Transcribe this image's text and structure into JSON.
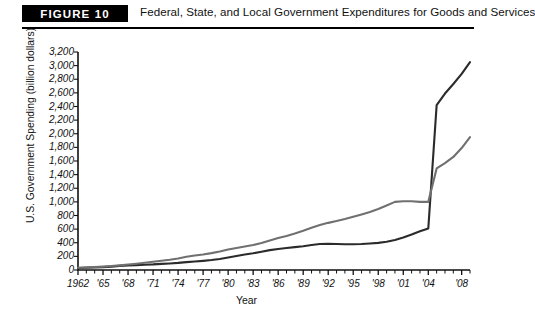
{
  "header": {
    "badge": "FIGURE 10",
    "caption": "Federal, State, and Local Government Expenditures for Goods and Services"
  },
  "axes": {
    "ylabel": "U.S. Government Spending (billion dollars)",
    "xlabel": "Year"
  },
  "chart_data": {
    "type": "line",
    "title": "Federal, State, and Local Government Expenditures for Goods and Services",
    "xlabel": "Year",
    "ylabel": "U.S. Government Spending (billion dollars)",
    "xlim": [
      1962,
      2009
    ],
    "ylim": [
      0,
      3200
    ],
    "grid": false,
    "legend": "none",
    "ytick_labels": [
      "3,200",
      "3,000",
      "2,800",
      "2,600",
      "2,400",
      "2,200",
      "2,000",
      "1,800",
      "1,600",
      "1,400",
      "1,200",
      "1,000",
      "800",
      "600",
      "400",
      "200",
      "0"
    ],
    "ytick_values": [
      3200,
      3000,
      2800,
      2600,
      2400,
      2200,
      2000,
      1800,
      1600,
      1400,
      1200,
      1000,
      800,
      600,
      400,
      200,
      0
    ],
    "xtick_labels": [
      "1962",
      "'65",
      "'68",
      "'71",
      "'74",
      "'77",
      "'80",
      "'83",
      "'86",
      "'89",
      "'92",
      "'95",
      "'98",
      "'01",
      "'04",
      "'08"
    ],
    "xtick_values": [
      1962,
      1965,
      1968,
      1971,
      1974,
      1977,
      1980,
      1983,
      1986,
      1989,
      1992,
      1995,
      1998,
      2001,
      2004,
      2008
    ],
    "x": [
      1962,
      1963,
      1964,
      1965,
      1966,
      1967,
      1968,
      1969,
      1970,
      1971,
      1972,
      1973,
      1974,
      1975,
      1976,
      1977,
      1978,
      1979,
      1980,
      1981,
      1982,
      1983,
      1984,
      1985,
      1986,
      1987,
      1988,
      1989,
      1990,
      1991,
      1992,
      1993,
      1994,
      1995,
      1996,
      1997,
      1998,
      1999,
      2000,
      2001,
      2002,
      2003,
      2004,
      2005,
      2006,
      2007,
      2008,
      2009
    ],
    "series": [
      {
        "name": "Federal",
        "color": "#2b2b2b",
        "values": [
          30,
          34,
          38,
          42,
          50,
          60,
          68,
          72,
          78,
          82,
          90,
          96,
          104,
          116,
          124,
          134,
          146,
          162,
          184,
          206,
          228,
          246,
          268,
          292,
          308,
          322,
          336,
          348,
          368,
          382,
          386,
          382,
          378,
          378,
          382,
          390,
          398,
          414,
          440,
          476,
          520,
          570,
          610,
          2420,
          2590,
          2730,
          2880,
          3050
        ]
      },
      {
        "name": "State and Local",
        "color": "#707070",
        "values": [
          34,
          38,
          44,
          50,
          58,
          68,
          80,
          92,
          106,
          122,
          136,
          150,
          170,
          194,
          212,
          228,
          248,
          272,
          300,
          324,
          344,
          366,
          396,
          432,
          470,
          500,
          536,
          576,
          620,
          660,
          692,
          718,
          748,
          782,
          816,
          852,
          896,
          948,
          1000,
          1010,
          1010,
          1000,
          1000,
          1490,
          1570,
          1660,
          1790,
          1950
        ]
      }
    ],
    "annotations": []
  }
}
